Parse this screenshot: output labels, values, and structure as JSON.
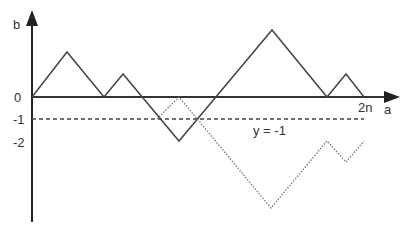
{
  "diagram": {
    "title": "",
    "axes": {
      "x_label": "a",
      "y_label": "b",
      "x_end_label": "2n",
      "y_ticks": [
        "0",
        "-1",
        "-2"
      ]
    },
    "reference_line": {
      "label": "y = -1",
      "style": "dashed",
      "y_value": -1
    },
    "paths": [
      {
        "name": "original-path",
        "style": "solid",
        "points_px": [
          [
            32,
            97
          ],
          [
            67,
            52
          ],
          [
            104,
            97
          ],
          [
            123,
            74
          ],
          [
            179,
            141
          ],
          [
            272,
            30
          ],
          [
            327,
            97
          ],
          [
            346,
            74
          ],
          [
            364,
            97
          ]
        ]
      },
      {
        "name": "reflected-path",
        "style": "dotted",
        "points_px": [
          [
            157,
            119
          ],
          [
            179,
            97
          ],
          [
            271,
            208
          ],
          [
            327,
            141
          ],
          [
            346,
            162
          ],
          [
            364,
            141
          ]
        ]
      }
    ],
    "colors": {
      "line": "#444444",
      "axis": "#222222",
      "text": "#333333",
      "dotted": "#777777"
    }
  }
}
